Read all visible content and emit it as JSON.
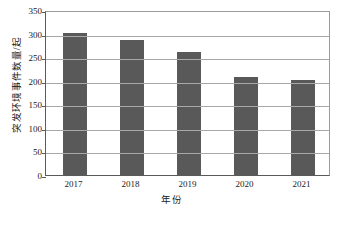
{
  "chart_data": {
    "type": "bar",
    "title": "",
    "categories": [
      "2017",
      "2018",
      "2019",
      "2020",
      "2021"
    ],
    "values": [
      302,
      287,
      262,
      208,
      201
    ],
    "series": [
      {
        "name": "突发环境事件数量",
        "values": [
          302,
          287,
          262,
          208,
          201
        ]
      }
    ],
    "xlabel": "年份",
    "ylabel": "突发环境事件数量/起",
    "ylim": [
      0,
      350
    ],
    "yticks": [
      0,
      50,
      100,
      150,
      200,
      250,
      300,
      350
    ],
    "ytick_labels": [
      "0",
      "50",
      "100",
      "150",
      "200",
      "250",
      "300",
      "350"
    ],
    "grid": true,
    "legend": false,
    "bar_color": "#595959",
    "gridline_color": "#a8a8a8",
    "axis_color": "#5a5a5a"
  },
  "axes": {
    "y_title": "突发环境事件数量/起",
    "x_title": "年份"
  },
  "caption": {
    "text": ""
  }
}
